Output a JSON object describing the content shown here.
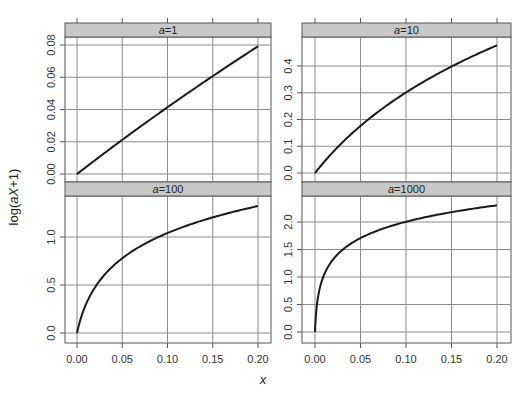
{
  "chart_data": {
    "type": "line",
    "title": "",
    "xlabel": "x",
    "ylabel": "log(aX+1)",
    "grid": true,
    "layout": "2x2 lattice panels",
    "x_ticks": [
      "0.00",
      "0.05",
      "0.10",
      "0.15",
      "0.20"
    ],
    "xlim": [
      0,
      0.2
    ],
    "panels": [
      {
        "strip": "a=1",
        "a": 1,
        "y_ticks": [
          "0.00",
          "0.02",
          "0.04",
          "0.06",
          "0.08"
        ],
        "ylim": [
          -0.003,
          0.084
        ],
        "x": [
          0,
          0.025,
          0.05,
          0.075,
          0.1,
          0.125,
          0.15,
          0.175,
          0.2
        ],
        "y": [
          0,
          0.0247,
          0.0488,
          0.0723,
          0.0953,
          0.1178,
          0.1398,
          0.1613,
          0.1823
        ],
        "note": "log10 values shown on plot: 0 to ~0.079"
      },
      {
        "strip": "a=10",
        "a": 10,
        "y_ticks": [
          "0.0",
          "0.1",
          "0.2",
          "0.3",
          "0.4"
        ],
        "ylim": [
          -0.02,
          0.5
        ]
      },
      {
        "strip": "a=100",
        "a": 100,
        "y_ticks": [
          "0.0",
          "0.5",
          "1.0"
        ],
        "ylim": [
          -0.05,
          1.4
        ]
      },
      {
        "strip": "a=1000",
        "a": 1000,
        "y_ticks": [
          "0.0",
          "0.5",
          "1.0",
          "1.5",
          "2.0"
        ],
        "ylim": [
          -0.08,
          2.4
        ]
      }
    ],
    "series": [
      {
        "name": "a=1",
        "x": [
          0,
          0.025,
          0.05,
          0.075,
          0.1,
          0.125,
          0.15,
          0.175,
          0.2
        ],
        "values": [
          0,
          0.0107,
          0.0212,
          0.0314,
          0.0414,
          0.0512,
          0.0607,
          0.07,
          0.0792
        ]
      },
      {
        "name": "a=10",
        "x": [
          0,
          0.025,
          0.05,
          0.075,
          0.1,
          0.125,
          0.15,
          0.175,
          0.2
        ],
        "values": [
          0,
          0.0969,
          0.1761,
          0.243,
          0.301,
          0.3522,
          0.3979,
          0.4393,
          0.4771
        ]
      },
      {
        "name": "a=100",
        "x": [
          0,
          0.025,
          0.05,
          0.075,
          0.1,
          0.125,
          0.15,
          0.175,
          0.2
        ],
        "values": [
          0,
          0.5441,
          0.7782,
          0.9345,
          1.0414,
          1.1303,
          1.2041,
          1.2672,
          1.3222
        ]
      },
      {
        "name": "a=1000",
        "x": [
          0,
          0.025,
          0.05,
          0.075,
          0.1,
          0.125,
          0.15,
          0.175,
          0.2
        ],
        "values": [
          0,
          1.415,
          1.7076,
          1.8808,
          2.0043,
          2.0993,
          2.179,
          2.2455,
          2.3032
        ]
      }
    ]
  },
  "labels": {
    "xlabel": "x",
    "ylabel": "log(aX+1)",
    "strips": [
      "a=1",
      "a=10",
      "a=100",
      "a=1000"
    ]
  },
  "colors": {
    "strip_fill": "#c8c8c8",
    "line": "#1a1a1a",
    "grid": "#8c8c8c",
    "frame": "#555555"
  }
}
